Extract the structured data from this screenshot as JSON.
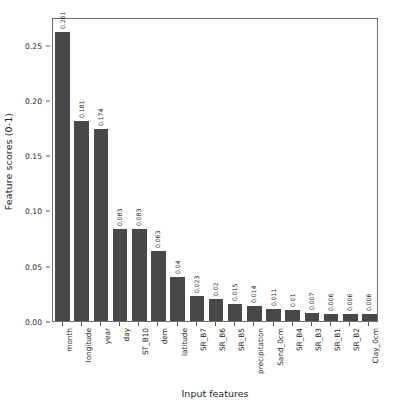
{
  "chart_data": {
    "type": "bar",
    "title": "",
    "xlabel": "Input features",
    "ylabel": "Feature scores (0-1)",
    "ylim": [
      0.0,
      0.275
    ],
    "yticks": [
      "0.00",
      "0.05",
      "0.10",
      "0.15",
      "0.20",
      "0.25"
    ],
    "ytick_values": [
      0.0,
      0.05,
      0.1,
      0.15,
      0.2,
      0.25
    ],
    "grid": false,
    "legend": "none",
    "bar_color": "#484848",
    "categories": [
      "month",
      "longitude",
      "year",
      "day",
      "ST_B10",
      "dem",
      "latitude",
      "SR_B7",
      "SR_B6",
      "SR_B5",
      "precipitation",
      "Sand_0cm",
      "SR_B4",
      "SR_B3",
      "SR_B1",
      "SR_B2",
      "Clay_0cm"
    ],
    "values": [
      0.261,
      0.181,
      0.174,
      0.083,
      0.083,
      0.063,
      0.04,
      0.023,
      0.02,
      0.015,
      0.014,
      0.011,
      0.01,
      0.007,
      0.006,
      0.006,
      0.006
    ],
    "value_labels": [
      "0.261",
      "0.181",
      "0.174",
      "0.083",
      "0.083",
      "0.063",
      "0.04",
      "0.023",
      "0.02",
      "0.015",
      "0.014",
      "0.011",
      "0.01",
      "0.007",
      "0.006",
      "0.006",
      "0.006"
    ]
  }
}
